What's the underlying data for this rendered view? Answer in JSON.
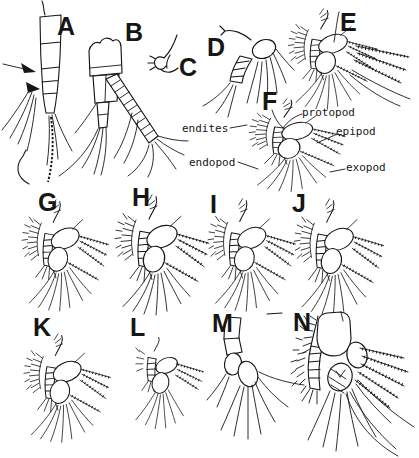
{
  "figure": {
    "background": "#ffffff",
    "ink": "#161616",
    "panels": [
      {
        "letter": "A"
      },
      {
        "letter": "B"
      },
      {
        "letter": "C"
      },
      {
        "letter": "D"
      },
      {
        "letter": "E"
      },
      {
        "letter": "F"
      },
      {
        "letter": "G"
      },
      {
        "letter": "H"
      },
      {
        "letter": "I"
      },
      {
        "letter": "J"
      },
      {
        "letter": "K"
      },
      {
        "letter": "L"
      },
      {
        "letter": "M"
      },
      {
        "letter": "N"
      }
    ],
    "labels": [
      {
        "text": "endites"
      },
      {
        "text": "protopod"
      },
      {
        "text": "epipod"
      },
      {
        "text": "endopod"
      },
      {
        "text": "exopod"
      }
    ]
  }
}
